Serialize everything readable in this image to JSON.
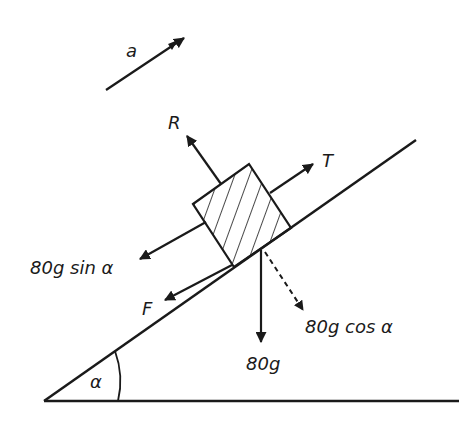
{
  "diagram": {
    "labels": {
      "acceleration": "a",
      "reaction": "R",
      "tension": "T",
      "weight_component_parallel": "80g sin α",
      "friction": "F",
      "weight": "80g",
      "weight_component_perpendicular": "80g cos α",
      "angle": "α"
    },
    "colors": {
      "stroke": "#1a1a1a",
      "background": "#ffffff"
    }
  }
}
